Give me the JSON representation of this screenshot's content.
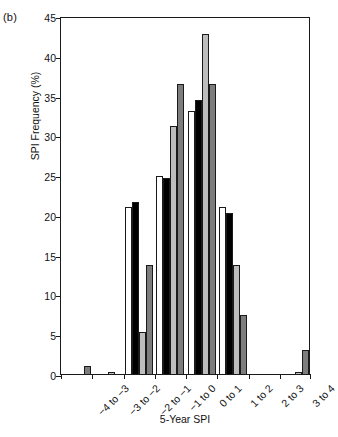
{
  "panel": {
    "label": "(b)"
  },
  "axes": {
    "ylabel": "SPI Frequency (%)",
    "xlabel": "5-Year SPI",
    "yticks": [
      "0",
      "5",
      "10",
      "15",
      "20",
      "25",
      "30",
      "35",
      "40",
      "45"
    ]
  },
  "chart_data": {
    "type": "bar",
    "title": "",
    "xlabel": "5-Year SPI",
    "ylabel": "SPI Frequency (%)",
    "ylim": [
      0,
      45
    ],
    "ytick_step": 5,
    "grid": false,
    "legend": "none",
    "categories": [
      "−4 to −3",
      "−3 to −2",
      "−2 to −1",
      "−1 to 0",
      "0 to 1",
      "1 to 2",
      "2 to 3",
      "3 to 4"
    ],
    "series": [
      {
        "name": "series-1",
        "color": "#ffffff",
        "values": [
          0,
          0,
          21.0,
          24.9,
          33.0,
          21.0,
          0,
          0
        ]
      },
      {
        "name": "series-2",
        "color": "#000000",
        "values": [
          0,
          0,
          21.6,
          24.6,
          34.4,
          20.3,
          0,
          0
        ]
      },
      {
        "name": "series-3",
        "color": "#bdbdbd",
        "values": [
          0,
          0.3,
          5.3,
          31.2,
          42.7,
          13.7,
          0,
          0.3
        ]
      },
      {
        "name": "series-4",
        "color": "#7d7d7d",
        "values": [
          1.0,
          0,
          13.7,
          36.5,
          36.5,
          7.4,
          0,
          3.0
        ]
      }
    ]
  }
}
